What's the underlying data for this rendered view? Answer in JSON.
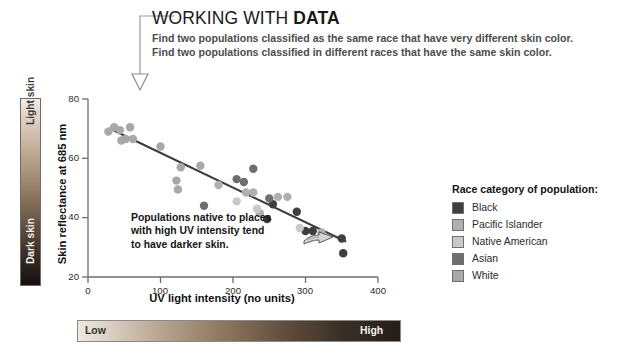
{
  "header": {
    "title_regular": "WORKING WITH ",
    "title_bold": "DATA",
    "subtitle_line1": "Find two populations classified as the same race that have very different skin color.",
    "subtitle_line2": "Find two populations classified in different races that have the same skin color."
  },
  "skin_scale": {
    "light_label": "Light skin",
    "dark_label": "Dark skin"
  },
  "uv_scale": {
    "low_label": "Low",
    "high_label": "High"
  },
  "annotation": {
    "line1": "Populations native to places",
    "line2": "with high UV intensity tend",
    "line3": "to have darker skin."
  },
  "legend": {
    "title": "Race category of population:",
    "items": [
      {
        "label": "Black",
        "color": "#3f3f3f"
      },
      {
        "label": "Pacific Islander",
        "color": "#b0b0b0"
      },
      {
        "label": "Native American",
        "color": "#c9c9c9"
      },
      {
        "label": "Asian",
        "color": "#6e6e6e"
      },
      {
        "label": "White",
        "color": "#a8a8a8"
      }
    ]
  },
  "chart_data": {
    "type": "scatter",
    "title": "",
    "xlabel": "UV light intensity (no units)",
    "ylabel": "Skin reflectance at 685 nm",
    "xlim": [
      0,
      400
    ],
    "ylim": [
      20,
      80
    ],
    "xticks": [
      0,
      100,
      200,
      300,
      400
    ],
    "yticks": [
      20,
      40,
      60,
      80
    ],
    "grid": false,
    "legend_position": "right",
    "trendline": {
      "x0": 30,
      "y0": 70.0,
      "x1": 355,
      "y1": 32.0
    },
    "series": [
      {
        "name": "Black",
        "color": "#3f3f3f",
        "points": [
          [
            255,
            44.5
          ],
          [
            288,
            42.0
          ],
          [
            300,
            35.5
          ],
          [
            310,
            35.5
          ],
          [
            350,
            33.0
          ],
          [
            352,
            28.0
          ],
          [
            247,
            39.5
          ]
        ]
      },
      {
        "name": "Pacific Islander",
        "color": "#b0b0b0",
        "points": [
          [
            180,
            51.0
          ],
          [
            218,
            48.5
          ],
          [
            228,
            48.5
          ],
          [
            262,
            47.0
          ],
          [
            275,
            47.0
          ],
          [
            237,
            41.5
          ],
          [
            322,
            35.0
          ]
        ]
      },
      {
        "name": "Native American",
        "color": "#c9c9c9",
        "points": [
          [
            205,
            45.5
          ],
          [
            233,
            43.0
          ],
          [
            292,
            36.5
          ]
        ]
      },
      {
        "name": "Asian",
        "color": "#6e6e6e",
        "points": [
          [
            215,
            52.0
          ],
          [
            250,
            46.5
          ],
          [
            205,
            53.0
          ],
          [
            228,
            56.5
          ],
          [
            160,
            44.0
          ]
        ]
      },
      {
        "name": "White",
        "color": "#a8a8a8",
        "points": [
          [
            28,
            69.0
          ],
          [
            36,
            70.5
          ],
          [
            44,
            69.5
          ],
          [
            46,
            66.0
          ],
          [
            52,
            66.5
          ],
          [
            58,
            70.5
          ],
          [
            62,
            66.5
          ],
          [
            100,
            64.0
          ],
          [
            128,
            57.0
          ],
          [
            122,
            52.5
          ],
          [
            124,
            49.5
          ],
          [
            155,
            57.5
          ]
        ]
      }
    ]
  }
}
